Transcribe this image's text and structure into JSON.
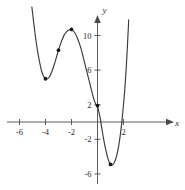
{
  "chart_data": {
    "type": "line",
    "title": "",
    "subtitle": "",
    "xlabel": "x",
    "ylabel": "y",
    "xlim": [
      -7.2,
      3.2
    ],
    "ylim": [
      -7.8,
      13.5
    ],
    "grid": false,
    "legend": null,
    "xticks": [
      -6,
      -4,
      -2,
      2
    ],
    "xtick_labels": [
      "-6",
      "-4",
      "-2",
      "2"
    ],
    "yticks": [
      10,
      6,
      2,
      -2,
      -6
    ],
    "ytick_labels": [
      "10",
      "6",
      "2",
      "-2",
      "-6"
    ],
    "axis_arrows": [
      "x-positive",
      "y-positive"
    ],
    "series": [
      {
        "name": "curve",
        "color": "#3a3a3a",
        "x": [
          -5.05,
          -4.9,
          -4.75,
          -4.6,
          -4.45,
          -4.3,
          -4.15,
          -4.0,
          -3.85,
          -3.7,
          -3.55,
          -3.4,
          -3.25,
          -3.1,
          -3.0,
          -2.85,
          -2.7,
          -2.55,
          -2.4,
          -2.25,
          -2.1,
          -2.0,
          -1.85,
          -1.7,
          -1.55,
          -1.4,
          -1.25,
          -1.1,
          -0.95,
          -0.8,
          -0.65,
          -0.5,
          -0.35,
          -0.2,
          -0.1,
          0.0,
          0.1,
          0.2,
          0.35,
          0.5,
          0.65,
          0.8,
          0.95,
          1.0,
          1.1,
          1.25,
          1.4,
          1.55,
          1.7,
          1.85,
          2.0,
          2.1,
          2.2,
          2.3,
          2.4
        ],
        "y": [
          13.3,
          11.4,
          9.6,
          8.1,
          6.9,
          5.9,
          5.3,
          5.0,
          5.0,
          5.2,
          5.7,
          6.3,
          7.0,
          7.8,
          8.3,
          9.0,
          9.6,
          10.1,
          10.4,
          10.6,
          10.7,
          10.7,
          10.5,
          10.2,
          9.7,
          9.1,
          8.4,
          7.5,
          6.6,
          5.7,
          4.8,
          3.9,
          3.0,
          2.3,
          2.0,
          1.8,
          1.2,
          0.5,
          -0.9,
          -2.2,
          -3.3,
          -4.2,
          -4.8,
          -4.9,
          -5.0,
          -4.8,
          -4.3,
          -3.4,
          -2.1,
          -0.3,
          2.0,
          3.8,
          6.0,
          8.7,
          11.8
        ]
      }
    ],
    "marked_points": [
      {
        "label": "local-minimum-left",
        "x": -4.0,
        "y": 5.0
      },
      {
        "label": "inflection-point",
        "x": -3.0,
        "y": 8.3
      },
      {
        "label": "local-maximum",
        "x": -2.0,
        "y": 10.7
      },
      {
        "label": "y-intercept",
        "x": 0.0,
        "y": 1.9
      },
      {
        "label": "local-minimum-right",
        "x": 1.0,
        "y": -4.9
      }
    ],
    "point_color": "#1a1a1a",
    "axis_color": "#4a4a4a"
  }
}
